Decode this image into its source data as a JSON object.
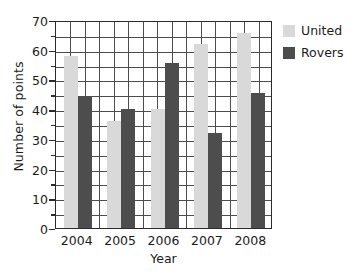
{
  "chart_data": {
    "type": "bar",
    "title": "",
    "xlabel": "Year",
    "ylabel": "Number of points",
    "categories": [
      "2004",
      "2005",
      "2006",
      "2007",
      "2008"
    ],
    "series": [
      {
        "name": "United",
        "values": [
          58,
          36,
          40,
          62,
          65.5
        ],
        "color": "#d9d9d9"
      },
      {
        "name": "Rovers",
        "values": [
          44.5,
          40,
          55.5,
          32,
          45.5
        ],
        "color": "#4d4d4d"
      }
    ],
    "ylim": [
      0,
      70
    ],
    "ytick_labels": [
      "0",
      "10",
      "20",
      "30",
      "40",
      "50",
      "60",
      "70"
    ],
    "ytick_values": [
      0,
      10,
      20,
      30,
      40,
      50,
      60,
      70
    ],
    "gridline_step": 5,
    "grid": true,
    "legend_position": "right"
  },
  "legend": {
    "entries": [
      {
        "label": "United",
        "color": "#d9d9d9"
      },
      {
        "label": "Rovers",
        "color": "#4d4d4d"
      }
    ]
  },
  "axes": {
    "x_title": "Year",
    "y_title": "Number of points"
  }
}
